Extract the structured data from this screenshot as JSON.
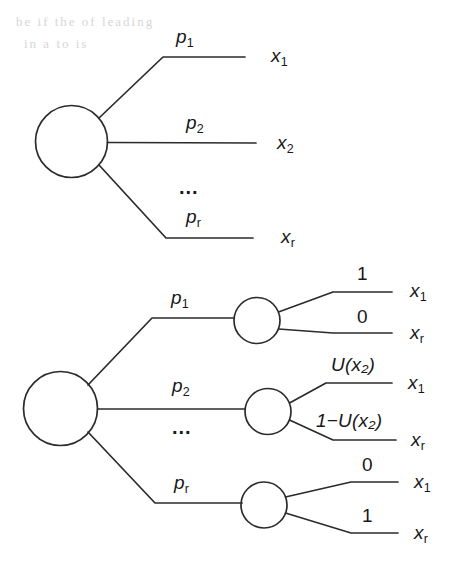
{
  "figure": {
    "stroke_color": "#2b2b2b",
    "background_color": "#ffffff",
    "scan_artifact_top": "be if the    of    leading",
    "scan_artifact_mid": "in    a  to  is",
    "upper_diagram": {
      "name": "compound-lottery",
      "root_node": "chance-node",
      "branches": [
        {
          "probability": "p",
          "probability_sub": "1",
          "outcome": "x",
          "outcome_sub": "1"
        },
        {
          "probability": "p",
          "probability_sub": "2",
          "outcome": "x",
          "outcome_sub": "2"
        },
        {
          "probability": "p",
          "probability_sub": "r",
          "outcome": "x",
          "outcome_sub": "r"
        }
      ],
      "ellipsis": "..."
    },
    "lower_diagram": {
      "name": "reduced-lottery",
      "root_node": "chance-node",
      "ellipsis": "...",
      "branches": [
        {
          "probability": "p",
          "probability_sub": "1",
          "sub_node": "chance-node-1",
          "sub_branches": [
            {
              "probability": "1",
              "outcome": "x",
              "outcome_sub": "1"
            },
            {
              "probability": "0",
              "outcome": "x",
              "outcome_sub": "r"
            }
          ]
        },
        {
          "probability": "p",
          "probability_sub": "2",
          "sub_node": "chance-node-2",
          "sub_branches": [
            {
              "probability": "U(x₂)",
              "outcome": "x",
              "outcome_sub": "1"
            },
            {
              "probability": "1−U(x₂)",
              "outcome": "x",
              "outcome_sub": "r"
            }
          ]
        },
        {
          "probability": "p",
          "probability_sub": "r",
          "sub_node": "chance-node-3",
          "sub_branches": [
            {
              "probability": "0",
              "outcome": "x",
              "outcome_sub": "1"
            },
            {
              "probability": "1",
              "outcome": "x",
              "outcome_sub": "r"
            }
          ]
        }
      ]
    }
  }
}
